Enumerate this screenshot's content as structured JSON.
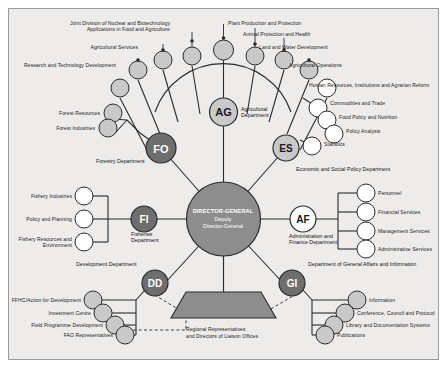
{
  "diagram": {
    "center": {
      "line1": "DIRECTOR-GENERAL",
      "line2": "Deputy",
      "line3": "Director-General"
    },
    "bottom_block": {
      "line1": "Regional Representatives",
      "line2": "and Directors of Liaison Offices"
    },
    "colors": {
      "background": "#edeceb",
      "hub_fill": "#8d8d8d",
      "dark_node": "#6e6e6e",
      "light_node": "#c9c9c9",
      "white_node": "#ffffff",
      "stroke": "#2b2b2b",
      "text": "#1a1a1a",
      "frame_border": "#9a9a9a"
    },
    "departments": [
      {
        "code": "AG",
        "name": "Agricultural Department",
        "style": "light",
        "divisions": [
          "Research and Technology Development",
          "Agricultural Services",
          "Joint Division of Nuclear and Biotechnology Applications in Food and Agriculture",
          "Plant Production and Protection",
          "Animal Protection and Health",
          "Land and Water Development",
          "Agricultural Operations"
        ]
      },
      {
        "code": "ES",
        "name": "Economic and Social Policy Department",
        "style": "light",
        "divisions": [
          "Human Resources, Institutions and Agrarian Reform",
          "Commodities and Trade",
          "Food Policy and Nutrition",
          "Policy Analysis",
          "Statistics"
        ]
      },
      {
        "code": "AF",
        "name": "Administration and Finance Department",
        "style": "white",
        "divisions": [
          "Personnel",
          "Financial Services",
          "Management Services",
          "Administrative Services"
        ]
      },
      {
        "code": "GI",
        "name": "Department of General Affairs and Information",
        "style": "dark",
        "divisions": [
          "Information",
          "Conference, Council and Protocol",
          "Library and Documentation Systems",
          "Publications"
        ]
      },
      {
        "code": "DD",
        "name": "Development Department",
        "style": "dark",
        "divisions": [
          "FFHC/Action for Development",
          "Investment Centre",
          "Field Programme Development",
          "FAO Representatives"
        ]
      },
      {
        "code": "FI",
        "name": "Fisheries Department",
        "style": "dark",
        "divisions": [
          "Fishery Industries",
          "Policy and Planning",
          "Fishery Resources and Environment"
        ]
      },
      {
        "code": "FO",
        "name": "Forestry Department",
        "style": "dark",
        "divisions": [
          "Forest Resources",
          "Forest Industries"
        ]
      }
    ]
  }
}
